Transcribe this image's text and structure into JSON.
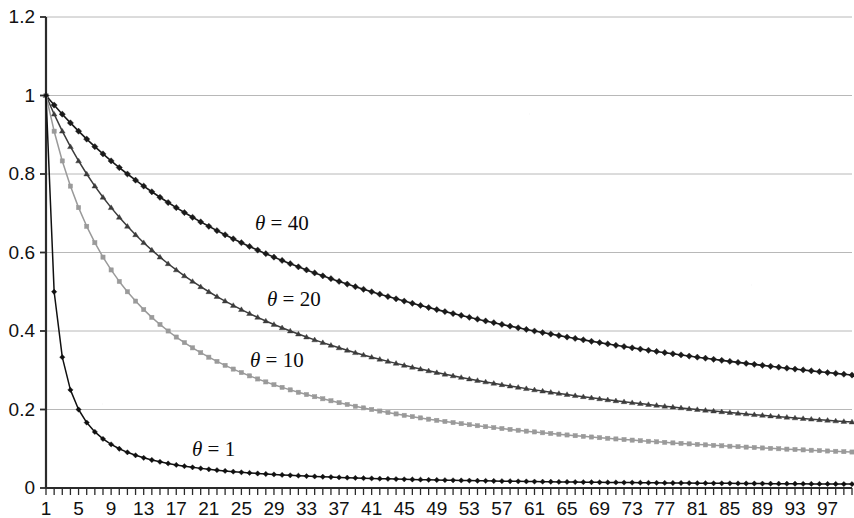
{
  "chart_data": {
    "type": "line",
    "title": "",
    "subtitle": "",
    "xlabel": "",
    "ylabel": "",
    "xlim": [
      1,
      100
    ],
    "ylim": [
      0,
      1.2
    ],
    "grid": true,
    "grid_axis": "y",
    "legend_position": "inline-annotations",
    "x_tick_labels": [
      "1",
      "5",
      "9",
      "13",
      "17",
      "21",
      "25",
      "29",
      "33",
      "37",
      "41",
      "45",
      "49",
      "53",
      "57",
      "61",
      "65",
      "69",
      "73",
      "77",
      "81",
      "85",
      "89",
      "93",
      "97"
    ],
    "x_tick_values": [
      1,
      5,
      9,
      13,
      17,
      21,
      25,
      29,
      33,
      37,
      41,
      45,
      49,
      53,
      57,
      61,
      65,
      69,
      73,
      77,
      81,
      85,
      89,
      93,
      97
    ],
    "x_minor_tick_step": 1,
    "y_tick_labels": [
      "0",
      "0.2",
      "0.4",
      "0.6",
      "0.8",
      "1",
      "1.2"
    ],
    "y_tick_values": [
      0,
      0.2,
      0.4,
      0.6,
      0.8,
      1,
      1.2
    ],
    "formula": "y = theta / (theta + x - 1)",
    "x": [
      1,
      2,
      3,
      4,
      5,
      6,
      7,
      8,
      9,
      10,
      11,
      12,
      13,
      14,
      15,
      16,
      17,
      18,
      19,
      20,
      21,
      22,
      23,
      24,
      25,
      26,
      27,
      28,
      29,
      30,
      31,
      32,
      33,
      34,
      35,
      36,
      37,
      38,
      39,
      40,
      41,
      42,
      43,
      44,
      45,
      46,
      47,
      48,
      49,
      50,
      51,
      52,
      53,
      54,
      55,
      56,
      57,
      58,
      59,
      60,
      61,
      62,
      63,
      64,
      65,
      66,
      67,
      68,
      69,
      70,
      71,
      72,
      73,
      74,
      75,
      76,
      77,
      78,
      79,
      80,
      81,
      82,
      83,
      84,
      85,
      86,
      87,
      88,
      89,
      90,
      91,
      92,
      93,
      94,
      95,
      96,
      97,
      98,
      99,
      100
    ],
    "series": [
      {
        "name": "theta = 40",
        "label": "θ = 40",
        "theta": 40,
        "color": "#1a1a1a",
        "marker": "diamond",
        "marker_size": 4.0,
        "line_width": 1.6,
        "values": [
          1,
          0.9756,
          0.9524,
          0.9302,
          0.9091,
          0.8889,
          0.8696,
          0.8511,
          0.8333,
          0.8163,
          0.8,
          0.7843,
          0.7692,
          0.7547,
          0.7407,
          0.7273,
          0.7143,
          0.7018,
          0.6897,
          0.678,
          0.6667,
          0.6557,
          0.6452,
          0.6349,
          0.625,
          0.6154,
          0.6061,
          0.597,
          0.5882,
          0.5797,
          0.5714,
          0.5634,
          0.5556,
          0.5479,
          0.5405,
          0.5333,
          0.5263,
          0.5195,
          0.5128,
          0.5063,
          0.5,
          0.4938,
          0.4878,
          0.4819,
          0.4762,
          0.4706,
          0.4651,
          0.4598,
          0.4545,
          0.4494,
          0.4444,
          0.4396,
          0.4348,
          0.4301,
          0.4255,
          0.4211,
          0.4167,
          0.4124,
          0.4082,
          0.404,
          0.4,
          0.396,
          0.3922,
          0.3883,
          0.3846,
          0.381,
          0.3774,
          0.3738,
          0.3704,
          0.367,
          0.3636,
          0.3604,
          0.3571,
          0.354,
          0.3509,
          0.3478,
          0.3448,
          0.3419,
          0.339,
          0.3361,
          0.3333,
          0.3306,
          0.3279,
          0.3252,
          0.3226,
          0.32,
          0.3175,
          0.315,
          0.3125,
          0.3101,
          0.3077,
          0.3053,
          0.303,
          0.3008,
          0.2985,
          0.2963,
          0.2941,
          0.292,
          0.2899,
          0.2878
        ]
      },
      {
        "name": "theta = 20",
        "label": "θ = 20",
        "theta": 20,
        "color": "#3c3c3c",
        "marker": "triangle",
        "marker_size": 4.0,
        "line_width": 1.5,
        "values": [
          1,
          0.9524,
          0.9091,
          0.8696,
          0.8333,
          0.8,
          0.7692,
          0.7407,
          0.7143,
          0.6897,
          0.6667,
          0.6452,
          0.625,
          0.6061,
          0.5882,
          0.5714,
          0.5556,
          0.5405,
          0.5263,
          0.5128,
          0.5,
          0.4878,
          0.4762,
          0.4651,
          0.4545,
          0.4444,
          0.4348,
          0.4255,
          0.4167,
          0.4082,
          0.4,
          0.3922,
          0.3846,
          0.3774,
          0.3704,
          0.3636,
          0.3571,
          0.3509,
          0.3448,
          0.339,
          0.3333,
          0.3279,
          0.3226,
          0.3175,
          0.3125,
          0.3077,
          0.303,
          0.2985,
          0.2941,
          0.2899,
          0.2857,
          0.2817,
          0.2778,
          0.274,
          0.2703,
          0.2667,
          0.2632,
          0.2597,
          0.2564,
          0.2532,
          0.25,
          0.2469,
          0.2439,
          0.241,
          0.2381,
          0.2353,
          0.2326,
          0.2299,
          0.2273,
          0.2247,
          0.2222,
          0.2198,
          0.2174,
          0.2151,
          0.2128,
          0.2105,
          0.2083,
          0.2062,
          0.2041,
          0.202,
          0.2,
          0.198,
          0.1961,
          0.1942,
          0.1923,
          0.1905,
          0.1887,
          0.1869,
          0.1852,
          0.1835,
          0.1818,
          0.1802,
          0.1786,
          0.177,
          0.1754,
          0.1739,
          0.1724,
          0.1709,
          0.1695,
          0.1681
        ]
      },
      {
        "name": "theta = 10",
        "label": "θ = 10",
        "theta": 10,
        "color": "#9a9a9a",
        "marker": "square",
        "marker_size": 4.2,
        "line_width": 1.5,
        "values": [
          1,
          0.9091,
          0.8333,
          0.7692,
          0.7143,
          0.6667,
          0.625,
          0.5882,
          0.5556,
          0.5263,
          0.5,
          0.4762,
          0.4545,
          0.4348,
          0.4167,
          0.4,
          0.3846,
          0.3704,
          0.3571,
          0.3448,
          0.3333,
          0.3226,
          0.3125,
          0.303,
          0.2941,
          0.2857,
          0.2778,
          0.2703,
          0.2632,
          0.2564,
          0.25,
          0.2439,
          0.2381,
          0.2326,
          0.2273,
          0.2222,
          0.2174,
          0.2128,
          0.2083,
          0.2041,
          0.2,
          0.1961,
          0.1923,
          0.1887,
          0.1852,
          0.1818,
          0.1786,
          0.1754,
          0.1724,
          0.1695,
          0.1667,
          0.1639,
          0.1613,
          0.1587,
          0.1563,
          0.1538,
          0.1515,
          0.1493,
          0.1471,
          0.1449,
          0.1429,
          0.1408,
          0.1389,
          0.137,
          0.1351,
          0.1333,
          0.1316,
          0.1299,
          0.1282,
          0.1266,
          0.125,
          0.1235,
          0.122,
          0.1205,
          0.119,
          0.1176,
          0.1163,
          0.1149,
          0.1136,
          0.1124,
          0.1111,
          0.1099,
          0.1087,
          0.1075,
          0.1064,
          0.1053,
          0.1042,
          0.1031,
          0.102,
          0.101,
          0.1,
          0.099,
          0.098,
          0.0971,
          0.0962,
          0.0952,
          0.0943,
          0.0935,
          0.0926,
          0.0917
        ]
      },
      {
        "name": "theta = 1",
        "label": "θ = 1",
        "theta": 1,
        "color": "#101010",
        "marker": "diamond",
        "marker_size": 3.4,
        "line_width": 1.5,
        "values": [
          1,
          0.5,
          0.3333,
          0.25,
          0.2,
          0.1667,
          0.1429,
          0.125,
          0.1111,
          0.1,
          0.0909,
          0.0833,
          0.0769,
          0.0714,
          0.0667,
          0.0625,
          0.0588,
          0.0556,
          0.0526,
          0.05,
          0.0476,
          0.0455,
          0.0435,
          0.0417,
          0.04,
          0.0385,
          0.037,
          0.0357,
          0.0345,
          0.0333,
          0.0323,
          0.0313,
          0.0303,
          0.0294,
          0.0286,
          0.0278,
          0.027,
          0.0263,
          0.0256,
          0.025,
          0.0244,
          0.0238,
          0.0233,
          0.0227,
          0.0222,
          0.0217,
          0.0213,
          0.0208,
          0.0204,
          0.02,
          0.0196,
          0.0192,
          0.0189,
          0.0185,
          0.0182,
          0.0179,
          0.0175,
          0.0172,
          0.0169,
          0.0167,
          0.0164,
          0.0161,
          0.0159,
          0.0156,
          0.0154,
          0.0152,
          0.0149,
          0.0147,
          0.0145,
          0.0143,
          0.0141,
          0.0139,
          0.0137,
          0.0135,
          0.0133,
          0.0132,
          0.013,
          0.0128,
          0.0127,
          0.0125,
          0.0123,
          0.0122,
          0.012,
          0.0119,
          0.0118,
          0.0116,
          0.0115,
          0.0114,
          0.0112,
          0.0111,
          0.011,
          0.0109,
          0.0108,
          0.0106,
          0.0105,
          0.0104,
          0.0103,
          0.0102,
          0.0101,
          0.01
        ]
      }
    ],
    "annotations": [
      {
        "text": "θ = 40",
        "x_px": 255,
        "y_px": 211
      },
      {
        "text": "θ = 20",
        "x_px": 267,
        "y_px": 287
      },
      {
        "text": "θ = 10",
        "x_px": 250,
        "y_px": 348
      },
      {
        "text": "θ = 1",
        "x_px": 192,
        "y_px": 437
      }
    ],
    "colors": {
      "axis": "#2b2b2b",
      "gridline": "#b8b8b8",
      "background": "#ffffff",
      "theta40": "#1a1a1a",
      "theta20": "#3c3c3c",
      "theta10": "#9a9a9a",
      "theta1": "#101010"
    }
  }
}
